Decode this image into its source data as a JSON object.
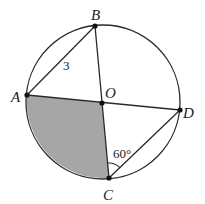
{
  "diagram": {
    "type": "circle-geometry",
    "circle": {
      "cx": 103,
      "cy": 102,
      "r": 77,
      "stroke": "#2a2a2a"
    },
    "center_point": {
      "label": "O",
      "x": 102,
      "y": 103
    },
    "points": [
      {
        "label": "A",
        "x": 27,
        "y": 95
      },
      {
        "label": "B",
        "x": 95,
        "y": 26
      },
      {
        "label": "C",
        "x": 109,
        "y": 178
      },
      {
        "label": "D",
        "x": 180,
        "y": 110
      },
      {
        "label": "O",
        "x": 102,
        "y": 103
      }
    ],
    "labels": {
      "A": "A",
      "B": "B",
      "C": "C",
      "D": "D",
      "O": "O"
    },
    "segments": [
      "AB",
      "AD",
      "BC",
      "CD"
    ],
    "segment_label": {
      "segment": "AB",
      "text": "3"
    },
    "angle_label": {
      "vertex": "C",
      "between": [
        "O",
        "D"
      ],
      "text": "60°"
    },
    "shaded_region": {
      "description": "sector AOC",
      "fill": "#a6a6a6"
    }
  }
}
